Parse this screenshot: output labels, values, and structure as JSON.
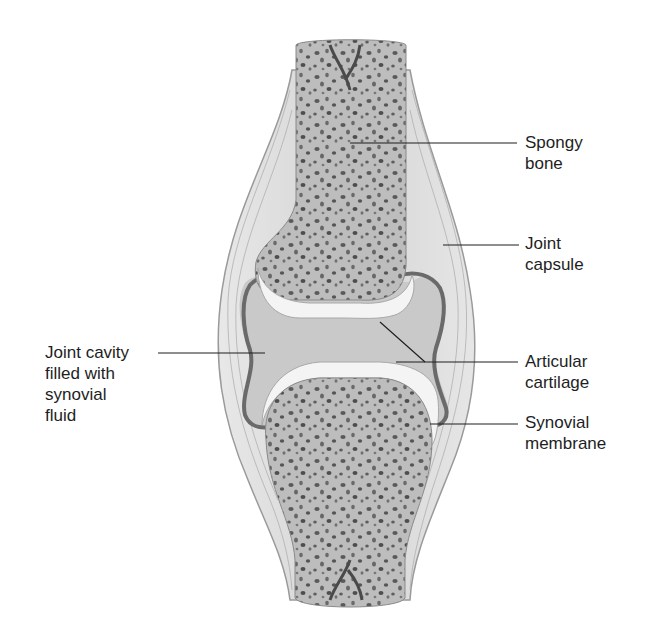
{
  "diagram": {
    "labels": {
      "spongy_bone": "Spongy\nbone",
      "joint_capsule": "Joint\ncapsule",
      "joint_cavity": "Joint cavity\nfilled with\nsynovial\nfluid",
      "articular_cartilage": "Articular\ncartilage",
      "synovial_membrane": "Synovial\nmembrane"
    },
    "colors": {
      "bone": "#bdbdbd",
      "bone_pore": "#5a5a5a",
      "capsule": "#d8d8d8",
      "capsule_edge": "#9a9a9a",
      "cavity": "#c9c9c9",
      "cartilage": "#f4f4f4",
      "membrane": "#6a6a6a",
      "leader": "#1e1e1e"
    }
  }
}
